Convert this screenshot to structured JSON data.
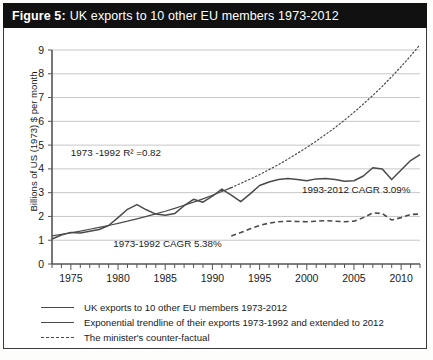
{
  "figure": {
    "label": "Figure 5:",
    "title": "UK exports to 10 other EU members 1973-2012"
  },
  "legend": [
    {
      "style": "solid",
      "label": "UK exports to 10 other EU members 1973-2012"
    },
    {
      "style": "solid",
      "label": "Exponential trendline of their exports 1973-1992 and extended to 2012"
    },
    {
      "style": "dashed",
      "label": "The minister's counter-factual"
    }
  ],
  "annotations": {
    "r2": "1973 -1992 R² =0.82",
    "cagr_early": "1973-1992 CAGR 5.38%",
    "cagr_late": "1993-2012 CAGR 3.09%"
  },
  "colors": {
    "titlebar_bg": "#111111",
    "titlebar_text": "#ffffff",
    "axis": "#555555",
    "grid": "#b8b8b8",
    "series": "#4a4a4a",
    "frame": "#3a3a3a"
  },
  "chart_data": {
    "type": "line",
    "title": "UK exports to 10 other EU members 1973-2012",
    "xlabel": "",
    "ylabel": "Billions of US (1973) $ per month",
    "xlim": [
      1973,
      2012
    ],
    "ylim": [
      0,
      9
    ],
    "grid": true,
    "legend_position": "below",
    "xticks": [
      1975,
      1980,
      1985,
      1990,
      1995,
      2000,
      2005,
      2010
    ],
    "xtick_minor_step": 1,
    "yticks": [
      0,
      1,
      2,
      3,
      4,
      5,
      6,
      7,
      8,
      9
    ],
    "x": [
      1973,
      1974,
      1975,
      1976,
      1977,
      1978,
      1979,
      1980,
      1981,
      1982,
      1983,
      1984,
      1985,
      1986,
      1987,
      1988,
      1989,
      1990,
      1991,
      1992,
      1993,
      1994,
      1995,
      1996,
      1997,
      1998,
      1999,
      2000,
      2001,
      2002,
      2003,
      2004,
      2005,
      2006,
      2007,
      2008,
      2009,
      2010,
      2011,
      2012
    ],
    "series": [
      {
        "name": "UK exports to 10 other EU members 1973-2012",
        "style": "solid",
        "values": [
          1.05,
          1.22,
          1.33,
          1.3,
          1.38,
          1.45,
          1.62,
          1.95,
          2.3,
          2.5,
          2.28,
          2.1,
          2.05,
          2.12,
          2.45,
          2.72,
          2.6,
          2.85,
          3.15,
          2.9,
          2.62,
          2.95,
          3.3,
          3.45,
          3.55,
          3.6,
          3.55,
          3.5,
          3.58,
          3.6,
          3.55,
          3.48,
          3.5,
          3.7,
          4.05,
          4.0,
          3.55,
          3.95,
          4.35,
          4.6
        ]
      },
      {
        "name": "Exponential trendline of their exports 1973-1992 and extended to 2012",
        "style": "solid-then-dotted",
        "solid_until": 1992,
        "values": [
          1.18,
          1.25,
          1.31,
          1.38,
          1.46,
          1.54,
          1.62,
          1.71,
          1.8,
          1.9,
          2.0,
          2.11,
          2.22,
          2.34,
          2.47,
          2.6,
          2.74,
          2.89,
          3.05,
          3.21,
          3.39,
          3.57,
          3.76,
          3.97,
          4.18,
          4.41,
          4.65,
          4.9,
          5.17,
          5.45,
          5.74,
          6.05,
          6.38,
          6.73,
          7.09,
          7.47,
          7.88,
          8.3,
          8.75,
          9.22
        ]
      },
      {
        "name": "The minister's counter-factual",
        "style": "dashed",
        "start_year": 1992,
        "values": [
          null,
          null,
          null,
          null,
          null,
          null,
          null,
          null,
          null,
          null,
          null,
          null,
          null,
          null,
          null,
          null,
          null,
          null,
          null,
          1.18,
          1.32,
          1.48,
          1.62,
          1.72,
          1.78,
          1.8,
          1.79,
          1.78,
          1.8,
          1.82,
          1.8,
          1.78,
          1.8,
          1.95,
          2.15,
          2.12,
          1.85,
          1.95,
          2.08,
          2.1
        ]
      }
    ],
    "annotations": [
      {
        "text": "1973 -1992 R² =0.82",
        "x": 1975.0,
        "y": 4.55
      },
      {
        "text": "1973-1992 CAGR 5.38%",
        "x": 1979.5,
        "y": 0.72
      },
      {
        "text": "1993-2012 CAGR 3.09%",
        "x": 1999.5,
        "y": 2.98
      }
    ]
  }
}
